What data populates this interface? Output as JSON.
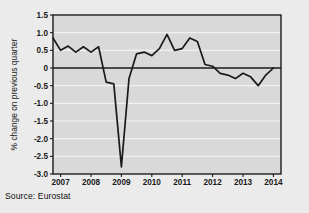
{
  "figure": {
    "source_note": "Source: Eurostat",
    "background_color": "#ebebeb",
    "plot_background_color": "#d9d9d9",
    "line_color": "#1a1a1a",
    "grid_color": "#f2f2f2",
    "axis_color": "#1a1a1a"
  },
  "chart_data": {
    "type": "line",
    "title": "",
    "subtitle": "",
    "xlabel": "",
    "ylabel": "% change on previous quarter",
    "ylim": [
      -3.0,
      1.5
    ],
    "xlim": [
      2006.75,
      2014.25
    ],
    "grid": true,
    "legend": null,
    "yticks": [
      1.5,
      1.0,
      0.5,
      0,
      -0.5,
      -1.0,
      -1.5,
      -2.0,
      -2.5,
      -3.0
    ],
    "ytick_labels": [
      "1.5",
      "1.0",
      "0.5",
      "0",
      "-0.5",
      "-1.0",
      "-1.5",
      "-2.0",
      "-2.5",
      "-3.0"
    ],
    "xticks": [
      2007,
      2008,
      2009,
      2010,
      2011,
      2012,
      2013,
      2014
    ],
    "xtick_labels": [
      "2007",
      "2008",
      "2009",
      "2010",
      "2011",
      "2012",
      "2013",
      "2014"
    ],
    "zero_line": 0,
    "series": [
      {
        "name": "Quarterly GDP change",
        "x": [
          2006.75,
          2007.0,
          2007.25,
          2007.5,
          2007.75,
          2008.0,
          2008.25,
          2008.5,
          2008.75,
          2009.0,
          2009.25,
          2009.5,
          2009.75,
          2010.0,
          2010.25,
          2010.5,
          2010.75,
          2011.0,
          2011.25,
          2011.5,
          2011.75,
          2012.0,
          2012.25,
          2012.5,
          2012.75,
          2013.0,
          2013.25,
          2013.5,
          2013.75,
          2014.0
        ],
        "values": [
          0.85,
          0.5,
          0.62,
          0.45,
          0.6,
          0.45,
          0.6,
          -0.4,
          -0.45,
          -2.8,
          -0.3,
          0.4,
          0.45,
          0.35,
          0.55,
          0.95,
          0.5,
          0.55,
          0.85,
          0.75,
          0.1,
          0.05,
          -0.15,
          -0.2,
          -0.3,
          -0.15,
          -0.25,
          -0.5,
          -0.2,
          0.0
        ]
      }
    ],
    "annotations": []
  }
}
